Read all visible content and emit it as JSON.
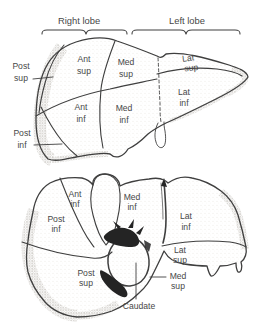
{
  "header": {
    "right_lobe": "Right lobe",
    "left_lobe": "Left lobe"
  },
  "anterior_view": {
    "labels": {
      "post_sup": {
        "line1": "Post",
        "line2": "sup"
      },
      "ant_sup": {
        "line1": "Ant",
        "line2": "sup"
      },
      "med_sup": {
        "line1": "Med",
        "line2": "sup"
      },
      "lat_sup": {
        "line1": "Lat",
        "line2": "sup"
      },
      "post_inf": {
        "line1": "Post",
        "line2": "inf"
      },
      "ant_inf": {
        "line1": "Ant",
        "line2": "inf"
      },
      "med_inf": {
        "line1": "Med",
        "line2": "inf"
      },
      "lat_inf": {
        "line1": "Lat",
        "line2": "inf"
      }
    }
  },
  "inferior_view": {
    "labels": {
      "ant_inf": {
        "line1": "Ant",
        "line2": "inf"
      },
      "med_inf": {
        "line1": "Med",
        "line2": "inf"
      },
      "post_inf": {
        "line1": "Post",
        "line2": "inf"
      },
      "lat_inf": {
        "line1": "Lat",
        "line2": "inf"
      },
      "post_sup": {
        "line1": "Post",
        "line2": "sup"
      },
      "lat_sup": {
        "line1": "Lat",
        "line2": "sup"
      },
      "med_sup": {
        "line1": "Med",
        "line2": "sup"
      },
      "caudate": {
        "line1": "Caudate"
      }
    }
  },
  "colors": {
    "background": "#ffffff",
    "line_ink": "#3f3f3f",
    "label_text": "#474747",
    "vessel_black": "#242424",
    "stipple_dark": "#a39e96",
    "stipple_light": "#d8d4cd"
  }
}
